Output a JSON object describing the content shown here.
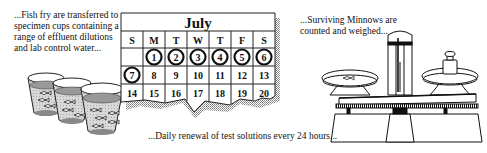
{
  "captions": {
    "step1": "...Fish fry are transferred to specimen cups containing a range of effluent dilutions and lab control water...",
    "step2": "...Daily renewal of test solutions every 24 hours...",
    "step3": "...Surviving Minnows are counted and weighed..."
  },
  "calendar": {
    "month": "July",
    "weekdays": [
      "S",
      "M",
      "T",
      "W",
      "T",
      "F",
      "S"
    ],
    "weeks": [
      [
        "",
        "1",
        "2",
        "3",
        "4",
        "5",
        "6"
      ],
      [
        "7",
        "8",
        "9",
        "10",
        "11",
        "12",
        "13"
      ],
      [
        "14",
        "15",
        "16",
        "17",
        "18",
        "19",
        "20"
      ]
    ],
    "circled_days": [
      "1",
      "2",
      "3",
      "4",
      "5",
      "6",
      "7"
    ]
  },
  "illustrations": {
    "cups": {
      "count": 3,
      "contents": "fish fry in effluent dilutions"
    },
    "scale": {
      "left_pan": "fish",
      "right_pan": "weight"
    }
  }
}
